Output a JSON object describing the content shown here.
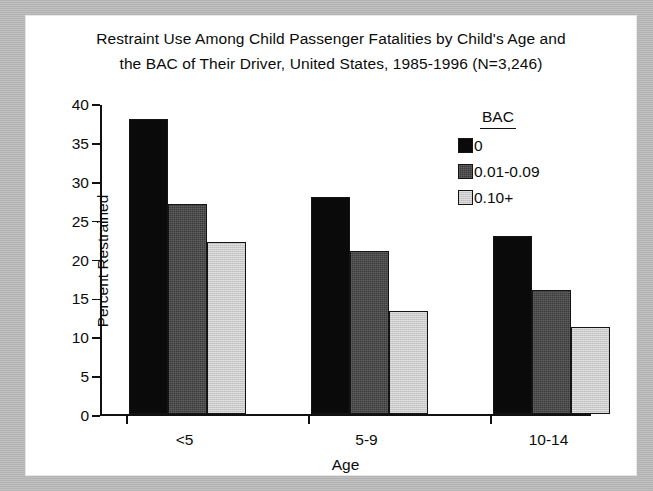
{
  "chart_data": {
    "type": "bar",
    "title": "Restraint Use Among Child Passenger Fatalities by Child's Age and the BAC of Their Driver, United States, 1985-1996 (N=3,246)",
    "title_lines": [
      "Restraint Use Among Child Passenger Fatalities by Child's Age and",
      "the BAC of Their Driver, United States, 1985-1996 (N=3,246)"
    ],
    "xlabel": "Age",
    "ylabel": "Percent Restrained",
    "categories": [
      "<5",
      "5-9",
      "10-14"
    ],
    "ylim": [
      0,
      40
    ],
    "yticks": [
      0,
      5,
      10,
      15,
      20,
      25,
      30,
      35,
      40
    ],
    "ytick_labels": [
      "0",
      "5",
      "10",
      "15",
      "20",
      "25",
      "30",
      "35",
      "40"
    ],
    "grid": false,
    "legend_title": "BAC",
    "legend_position": "top-right",
    "series": [
      {
        "name": "0",
        "values": [
          38.0,
          28.0,
          23.0
        ],
        "color": "#0a0a0a"
      },
      {
        "name": "0.01-0.09",
        "values": [
          27.0,
          21.0,
          16.0
        ],
        "color": "#3b3b3b"
      },
      {
        "name": "0.10+",
        "values": [
          22.2,
          13.3,
          11.2
        ],
        "color": "#c9c9c9"
      }
    ]
  },
  "figure": {
    "frame_color": "#bdbdbd",
    "plot_background": "#ffffff",
    "axis_color": "#111111"
  }
}
